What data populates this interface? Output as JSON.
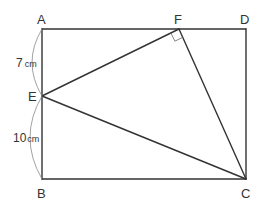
{
  "figure": {
    "type": "geometry",
    "shape": "rectangle ABCD with triangle EFC inscribed",
    "points": {
      "A": {
        "label": "A"
      },
      "B": {
        "label": "B"
      },
      "C": {
        "label": "C"
      },
      "D": {
        "label": "D"
      },
      "E": {
        "label": "E"
      },
      "F": {
        "label": "F"
      }
    },
    "segments": [
      {
        "from": "A",
        "to": "D"
      },
      {
        "from": "D",
        "to": "C"
      },
      {
        "from": "C",
        "to": "B"
      },
      {
        "from": "B",
        "to": "A"
      },
      {
        "from": "E",
        "to": "F"
      },
      {
        "from": "F",
        "to": "C"
      },
      {
        "from": "E",
        "to": "C"
      }
    ],
    "right_angle_at": "F",
    "measurements": [
      {
        "segment": "AE",
        "value": "7",
        "unit": "cm"
      },
      {
        "segment": "EB",
        "value": "10",
        "unit": "cm"
      }
    ]
  }
}
